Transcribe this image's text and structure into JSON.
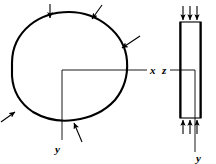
{
  "figure": {
    "title": "",
    "background_color": "#ffffff",
    "stroke_color": "#000000",
    "labels": {
      "x_axis": "x",
      "y_axis_left": "y",
      "z_axis": "z",
      "y_axis_right": "y"
    },
    "left_view": {
      "name": "plan-view-cross-section",
      "description": "closed irregular convex outline with in-plane load arrows and x-y axes",
      "outline_points": "12,62 14,44 20,31 30,22 44,16 58,13 72,13 86,16 100,22 112,31 121,43 126,56 127,70 124,84 117,97 106,108 92,116 76,120 60,121 46,119 33,113 22,103 15,90 12,76",
      "axis_origin": {
        "x": 62,
        "y": 70
      },
      "x_axis_end": {
        "x": 147,
        "y": 70
      },
      "y_axis_end": {
        "x": 62,
        "y": 140
      },
      "arrows": [
        {
          "name": "load-arrow-top-left",
          "x1": 50,
          "y1": 4,
          "x2": 50,
          "y2": 19,
          "label": ""
        },
        {
          "name": "load-arrow-top-right",
          "x1": 101,
          "y1": 5,
          "x2": 92,
          "y2": 20,
          "label": ""
        },
        {
          "name": "load-arrow-right",
          "x1": 139,
          "y1": 37,
          "x2": 121,
          "y2": 48,
          "label": ""
        },
        {
          "name": "load-arrow-bottom-left",
          "x1": 1,
          "y1": 121,
          "x2": 15,
          "y2": 112,
          "label": ""
        },
        {
          "name": "load-arrow-bottom",
          "x1": 81,
          "y1": 141,
          "x2": 73,
          "y2": 123,
          "label": ""
        }
      ]
    },
    "right_view": {
      "name": "elevation-view-section",
      "description": "thin vertical rectangular section with three downward arrows on top and three upward arrows on bottom",
      "rect": {
        "x": 180,
        "y": 22,
        "width": 21,
        "height": 96
      },
      "top_arrows": [
        {
          "name": "top-load-arrow-1",
          "x": 183,
          "y_start": 6,
          "y_end": 21
        },
        {
          "name": "top-load-arrow-2",
          "x": 190,
          "y_start": 6,
          "y_end": 21
        },
        {
          "name": "top-load-arrow-3",
          "x": 197,
          "y_start": 6,
          "y_end": 21
        }
      ],
      "bottom_arrows": [
        {
          "name": "bottom-reaction-arrow-1",
          "x": 183,
          "y_start": 134,
          "y_end": 119
        },
        {
          "name": "bottom-reaction-arrow-2",
          "x": 190,
          "y_start": 134,
          "y_end": 119
        },
        {
          "name": "bottom-reaction-arrow-3",
          "x": 197,
          "y_start": 134,
          "y_end": 119
        }
      ],
      "z_axis": {
        "x1": 170,
        "y1": 70,
        "x2": 195,
        "y2": 70
      },
      "y_axis": {
        "x1": 195,
        "y1": 70,
        "x2": 195,
        "y2": 152
      }
    },
    "label_positions": {
      "x": {
        "x": 150,
        "y": 74
      },
      "y_left": {
        "x": 56,
        "y": 152
      },
      "z": {
        "x": 163,
        "y": 74
      },
      "y_right": {
        "x": 197,
        "y": 161
      }
    }
  }
}
